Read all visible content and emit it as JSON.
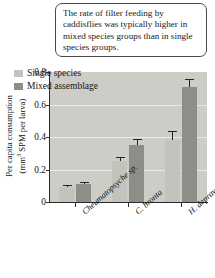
{
  "caption": {
    "text": "The rate of filter feeding by caddisflies was typically higher in mixed species groups than in single species groups."
  },
  "chart_data": {
    "type": "bar",
    "title": "",
    "xlabel": "",
    "ylabel": "Per capita consumption (mm3 SPM per larva)",
    "ylabel_line1": "Per capita consumption",
    "ylabel_line2_pre": "(mm",
    "ylabel_line2_sup": "3",
    "ylabel_line2_post": " SPM per larva)",
    "ylim": [
      0,
      0.8
    ],
    "ytick_labels": [
      "0",
      "0.2",
      "0.4",
      "0.6",
      "0.8"
    ],
    "ytick_values": [
      0,
      0.2,
      0.4,
      0.6,
      0.8
    ],
    "grid": true,
    "legend_position": "top-left-inside",
    "categories": [
      "Cheumatopsyche sp.",
      "C. bronta",
      "H. depravata"
    ],
    "category_labels": [
      {
        "genus": "Cheumatopsyche",
        "epithet": "sp."
      },
      {
        "genus": "C.",
        "epithet": "bronta"
      },
      {
        "genus": "H.",
        "epithet": "depravata"
      }
    ],
    "series": [
      {
        "name": "Single species",
        "color": "#c3c3bd",
        "values": [
          0.09,
          0.25,
          0.38
        ],
        "errors": [
          0.012,
          0.03,
          0.06
        ]
      },
      {
        "name": "Mixed assemblage",
        "color": "#8e8e88",
        "values": [
          0.11,
          0.35,
          0.71
        ],
        "errors": [
          0.012,
          0.035,
          0.045
        ]
      }
    ]
  },
  "colors": {
    "plot_background": "#cdcdc8",
    "gridline": "#e9e9e6",
    "axis": "#2b2b2b",
    "single_species_bar": "#c3c3bd",
    "mixed_assemblage_bar": "#8e8e88",
    "error_bar": "#232323",
    "caption_border": "#4a4a4a"
  }
}
